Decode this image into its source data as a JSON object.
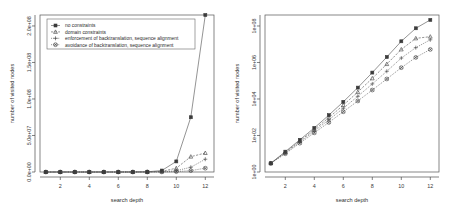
{
  "figure": {
    "background": "#ffffff",
    "ink_color": "#3b3b3b"
  },
  "legend": {
    "position": "top-left-of-left-panel",
    "items": [
      {
        "label": "no constraints",
        "marker": "filled-square",
        "line": "solid"
      },
      {
        "label": "domain constraints",
        "marker": "triangle",
        "line": "dashed"
      },
      {
        "label": "enforcement of backtranslation, sequence alignment",
        "marker": "plus",
        "line": "dotted"
      },
      {
        "label": "avoidance of backtranslation, sequence alignment",
        "marker": "cross-circle",
        "line": "dotted"
      }
    ]
  },
  "chart_data": [
    {
      "type": "line",
      "id": "left-linear-panel",
      "title": "",
      "xlabel": "search depth",
      "ylabel": "number of visited nodes",
      "scale": "linear",
      "grid": false,
      "legend_position": "upper left",
      "x": [
        1,
        2,
        3,
        4,
        5,
        6,
        7,
        8,
        9,
        10,
        11,
        12
      ],
      "xticks": [
        2,
        4,
        6,
        8,
        10,
        12
      ],
      "xlim": [
        0.6,
        12.6
      ],
      "yticks": [
        0,
        50000000,
        100000000,
        150000000,
        200000000
      ],
      "yticklabels": [
        "0.0e+00",
        "5.0e+07",
        "1.0e+08",
        "1.5e+08",
        "2.0e+08"
      ],
      "ylim": [
        0,
        215000000
      ],
      "series": [
        {
          "name": "no constraints",
          "marker": "filled-square",
          "line": "solid",
          "values": [
            3,
            13,
            58,
            260,
            1300,
            7000,
            42000,
            280000,
            2000000,
            14500000,
            75000000,
            215000000
          ]
        },
        {
          "name": "domain constraints",
          "marker": "triangle",
          "line": "dashed",
          "values": [
            3,
            12,
            50,
            210,
            950,
            4600,
            24000,
            135000,
            820000,
            5200000,
            21000000,
            26000000
          ]
        },
        {
          "name": "enforcement of backtranslation, sequence alignment",
          "marker": "plus",
          "line": "dotted",
          "values": [
            3,
            11,
            44,
            175,
            720,
            3100,
            14000,
            67000,
            330000,
            1750000,
            6500000,
            17500000
          ]
        },
        {
          "name": "avoidance of backtranslation, sequence alignment",
          "marker": "cross-circle",
          "line": "dotted",
          "values": [
            3,
            10,
            38,
            140,
            520,
            2000,
            7800,
            31000,
            125000,
            520000,
            1900000,
            5200000
          ]
        }
      ]
    },
    {
      "type": "line",
      "id": "right-log-panel",
      "title": "",
      "xlabel": "search depth",
      "ylabel": "number of visited nodes",
      "scale": "log",
      "grid": false,
      "legend_position": "none",
      "x": [
        1,
        2,
        3,
        4,
        5,
        6,
        7,
        8,
        9,
        10,
        11,
        12
      ],
      "xticks": [
        2,
        4,
        6,
        8,
        10,
        12
      ],
      "xlim": [
        0.6,
        12.6
      ],
      "yticks": [
        1,
        100,
        10000,
        1000000,
        100000000
      ],
      "yticklabels": [
        "1e+00",
        "1e+02",
        "1e+04",
        "1e+06",
        "1e+08"
      ],
      "ylim": [
        1,
        400000000
      ],
      "series": [
        {
          "name": "no constraints",
          "marker": "filled-square",
          "line": "solid",
          "values": [
            3,
            13,
            58,
            260,
            1300,
            7000,
            42000,
            280000,
            2000000,
            14500000,
            75000000,
            215000000
          ]
        },
        {
          "name": "domain constraints",
          "marker": "triangle",
          "line": "dashed",
          "values": [
            3,
            12,
            50,
            210,
            950,
            4600,
            24000,
            135000,
            820000,
            5200000,
            21000000,
            26000000
          ]
        },
        {
          "name": "enforcement of backtranslation, sequence alignment",
          "marker": "plus",
          "line": "dotted",
          "values": [
            3,
            11,
            44,
            175,
            720,
            3100,
            14000,
            67000,
            330000,
            1750000,
            6500000,
            17500000
          ]
        },
        {
          "name": "avoidance of backtranslation, sequence alignment",
          "marker": "cross-circle",
          "line": "dotted",
          "values": [
            3,
            10,
            38,
            140,
            520,
            2000,
            7800,
            31000,
            125000,
            520000,
            1900000,
            5200000
          ]
        }
      ]
    }
  ]
}
